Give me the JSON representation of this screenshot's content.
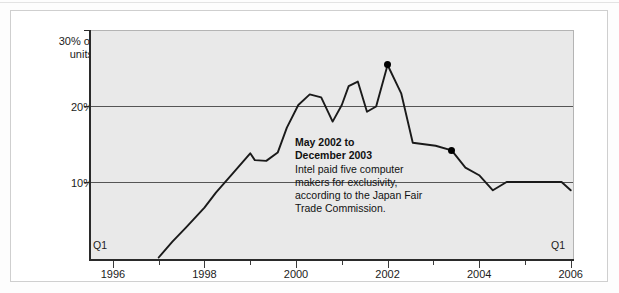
{
  "figure": {
    "background": "#ffffff",
    "plot_background": "#e9e9e9",
    "line_color": "#1a1a1a",
    "grid_color": "#555555"
  },
  "axis": {
    "y_top_label_line1": "30% of",
    "y_top_label_line2": "units",
    "y_tick_20": "20%",
    "y_tick_10": "10%",
    "q1_left": "Q1",
    "q1_right": "Q1",
    "x_labels": [
      "1996",
      "1998",
      "2000",
      "2002",
      "2004",
      "2006"
    ]
  },
  "annotation": {
    "headline_line1": "May 2002 to",
    "headline_line2": "December 2003",
    "body": "Intel paid five computer makers for exclusivity, according to the Japan Fair Trade Commission."
  },
  "chart_data": {
    "type": "line",
    "title": "",
    "subtitle": "",
    "xlabel": "",
    "ylabel": "30% of units",
    "xlim": [
      1995.5,
      2006.05
    ],
    "ylim": [
      0,
      30
    ],
    "ytick_values": [
      10,
      20,
      30
    ],
    "ytick_labels": [
      "10%",
      "20%",
      "30% of units"
    ],
    "xtick_major": [
      1996,
      1998,
      2000,
      2002,
      2004,
      2006
    ],
    "xtick_minor": [
      1997,
      1999,
      2001,
      2003,
      2005
    ],
    "grid": "horizontal gridlines at 10% and 20%",
    "legend": "none",
    "units": "percent of units",
    "series": [
      {
        "name": "AMD share of Japanese PC units",
        "color": "#1a1a1a",
        "x": [
          1997.0,
          1997.3,
          1997.6,
          1998.0,
          1998.25,
          1998.6,
          1999.0,
          1999.1,
          1999.35,
          1999.6,
          1999.8,
          2000.05,
          2000.3,
          2000.55,
          2000.8,
          2001.0,
          2001.15,
          2001.35,
          2001.55,
          2001.75,
          2002.0,
          2002.3,
          2002.55,
          2002.8,
          2003.05,
          2003.4,
          2003.7,
          2004.0,
          2004.3,
          2004.6,
          2005.0,
          2005.5,
          2005.8,
          2006.0
        ],
        "y": [
          0.0,
          2.1,
          4.0,
          6.6,
          8.6,
          11.0,
          13.8,
          12.9,
          12.8,
          13.9,
          17.2,
          20.2,
          21.6,
          21.2,
          18.0,
          20.2,
          22.7,
          23.3,
          19.3,
          20.0,
          25.5,
          21.7,
          15.2,
          15.0,
          14.8,
          14.2,
          11.9,
          10.9,
          8.9,
          10.0,
          10.0,
          10.0,
          10.0,
          8.9
        ]
      }
    ],
    "markers": [
      {
        "label": "May 2002",
        "x": 2002.0,
        "y": 25.5,
        "style": "filled-circle",
        "color": "#000000"
      },
      {
        "label": "December 2003",
        "x": 2003.4,
        "y": 14.2,
        "style": "filled-circle",
        "color": "#000000"
      }
    ],
    "annotations": [
      {
        "text": "May 2002 to December 2003 Intel paid five computer makers for exclusivity, according to the Japan Fair Trade Commission.",
        "x": 2001.7,
        "y": 13.5
      }
    ]
  }
}
